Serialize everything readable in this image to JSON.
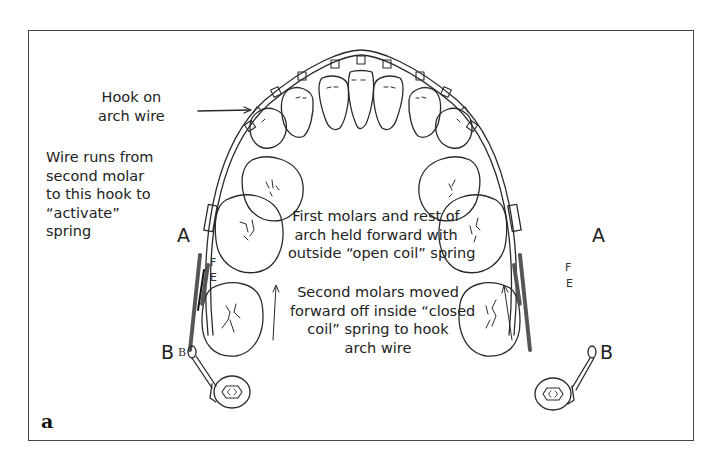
{
  "figure": {
    "panel_label": "a"
  },
  "labels": {
    "hook": [
      "Hook on",
      "arch wire"
    ],
    "wire_runs": [
      "Wire runs from",
      "second molar",
      "to this hook to",
      "“activate”",
      "spring"
    ],
    "first_molars": [
      "First molars and rest of",
      "arch held forward with",
      "outside “open coil” spring"
    ],
    "second_molars": [
      "Second molars moved",
      "forward off inside “closed",
      "coil” spring to hook",
      "arch wire"
    ]
  },
  "markers": {
    "left_A": "A",
    "left_B": "B",
    "left_B_small": "B",
    "left_F": "F",
    "left_E": "E",
    "right_A": "A",
    "right_B": "B",
    "right_F": "F",
    "right_E": "E"
  },
  "colors": {
    "line": "#2a2a2a",
    "frame": "#444444",
    "background": "#ffffff"
  }
}
